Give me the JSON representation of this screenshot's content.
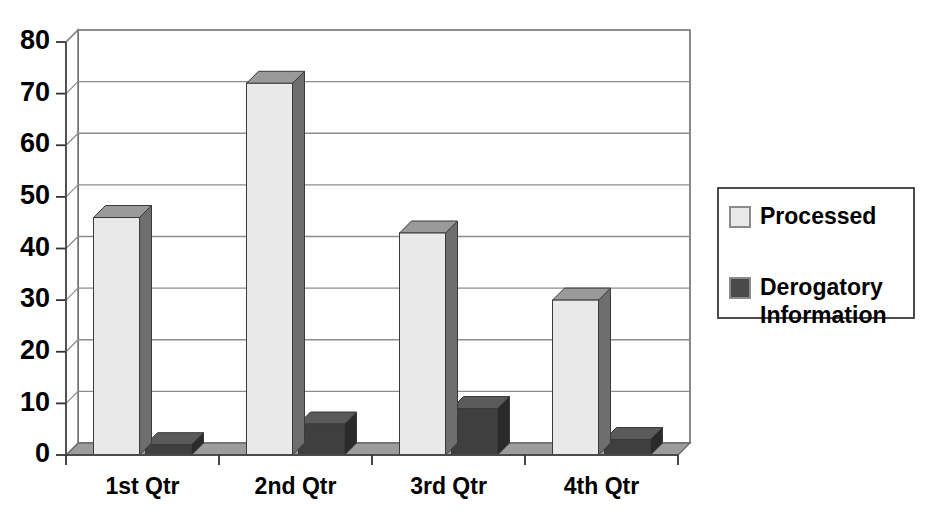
{
  "chart_data": {
    "type": "bar",
    "title": "",
    "subtitle": "",
    "xlabel": "",
    "ylabel": "",
    "categories": [
      "1st Qtr",
      "2nd Qtr",
      "3rd Qtr",
      "4th Qtr"
    ],
    "series": [
      {
        "name": "Processed",
        "values": [
          46,
          72,
          43,
          30
        ],
        "color": "#e9e9e9"
      },
      {
        "name": "Derogatory Information",
        "values": [
          2,
          6,
          9,
          3
        ],
        "color": "#4a4a4a"
      }
    ],
    "ylim": [
      0,
      80
    ],
    "yticks": [
      0,
      10,
      20,
      30,
      40,
      50,
      60,
      70,
      80
    ],
    "ytick_labels": [
      "0",
      "10",
      "20",
      "30",
      "40",
      "50",
      "60",
      "70",
      "80"
    ],
    "grid": true,
    "grid_axis": "y",
    "legend_position": "right",
    "style": "3d-column",
    "annotations": []
  },
  "axis": {
    "y_ticks": [
      {
        "value": 80,
        "label": "80"
      },
      {
        "value": 70,
        "label": "70"
      },
      {
        "value": 60,
        "label": "60"
      },
      {
        "value": 50,
        "label": "50"
      },
      {
        "value": 40,
        "label": "40"
      },
      {
        "value": 30,
        "label": "30"
      },
      {
        "value": 20,
        "label": "20"
      },
      {
        "value": 10,
        "label": "10"
      },
      {
        "value": 0,
        "label": "0"
      }
    ],
    "x_categories": [
      "1st Qtr",
      "2nd Qtr",
      "3rd Qtr",
      "4th Qtr"
    ]
  },
  "legend": {
    "entries": [
      {
        "label": "Processed",
        "swatch_color": "#e9e9e9"
      },
      {
        "label": "Derogatory",
        "label2": "Information",
        "swatch_color": "#4a4a4a"
      }
    ]
  },
  "colors": {
    "processed_front": "#e9e9e9",
    "processed_side": "#6e6e6e",
    "processed_top": "#9a9a9a",
    "derogatory_front": "#3f3f3f",
    "derogatory_side": "#2a2a2a",
    "derogatory_top": "#5a5a5a",
    "floor": "#9c9c9c",
    "grid": "#8c8c8c",
    "axis": "#555555",
    "background": "#ffffff",
    "text": "#000000"
  }
}
